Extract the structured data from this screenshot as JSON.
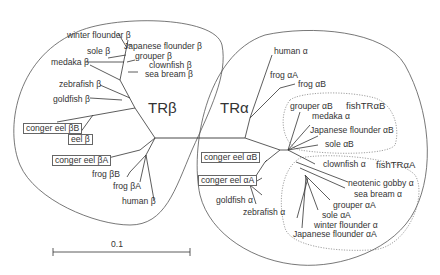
{
  "figure": {
    "type": "unrooted phylogenetic tree",
    "scale_bar_label": "0.1",
    "clades": {
      "tr_beta": "TRβ",
      "tr_alpha": "TRα",
      "fish_tr_alpha_b": "fishTRαB",
      "fish_tr_alpha_a": "fishTRαA"
    },
    "tr_beta_leaves": [
      "winter flounder β",
      "Japanese flounder β",
      "sole β",
      "grouper β",
      "medaka β",
      "clownfish β",
      "sea bream β",
      "zebrafish β",
      "goldfish β",
      "conger eel βB",
      "eel β",
      "conger eel βA",
      "frog βB",
      "frog βA",
      "human β"
    ],
    "tr_alpha_leaves": [
      "human α",
      "frog αA",
      "frog αB",
      "grouper αB",
      "medaka α",
      "Japanese flounder αB",
      "sole αB",
      "conger eel αB",
      "clownfish α",
      "conger eel αA",
      "neotenic gobby α",
      "sea bream α",
      "goldfish α",
      "grouper αA",
      "zebrafish α",
      "sole αA",
      "winter flounder α",
      "Japanese flounder αA"
    ],
    "boxed_labels": [
      "conger eel βB",
      "eel β",
      "conger eel βA",
      "conger eel αB",
      "conger eel αA"
    ]
  }
}
